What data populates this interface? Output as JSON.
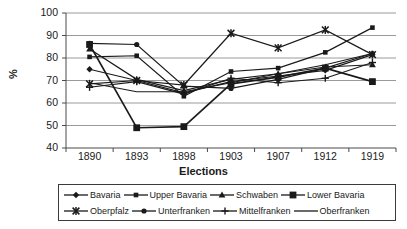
{
  "chart_data": {
    "type": "line",
    "title": "",
    "xlabel": "Elections",
    "ylabel": "%",
    "categories": [
      "1890",
      "1893",
      "1898",
      "1903",
      "1907",
      "1912",
      "1919"
    ],
    "x": [
      1890,
      1893,
      1898,
      1903,
      1907,
      1912,
      1919
    ],
    "ylim": [
      40,
      100
    ],
    "yticks": [
      40,
      50,
      60,
      70,
      80,
      90,
      100
    ],
    "grid": "horizontal",
    "legend_position": "bottom",
    "series": [
      {
        "name": "Bavaria",
        "marker": "diamond",
        "values": [
          75.0,
          70.0,
          64.5,
          69.5,
          72.0,
          74.5,
          81.5
        ]
      },
      {
        "name": "Upper Bavaria",
        "marker": "small-square",
        "values": [
          80.5,
          81.0,
          63.0,
          74.0,
          75.5,
          82.5,
          93.5
        ]
      },
      {
        "name": "Schwaben",
        "marker": "triangle",
        "values": [
          84.0,
          70.5,
          65.5,
          70.5,
          73.0,
          76.0,
          77.0
        ]
      },
      {
        "name": "Lower Bavaria",
        "marker": "large-square",
        "values": [
          86.0,
          49.0,
          49.5,
          68.5,
          71.5,
          75.5,
          69.5
        ]
      },
      {
        "name": "Oberpfalz",
        "marker": "star",
        "values": [
          68.5,
          70.0,
          68.0,
          91.0,
          84.5,
          92.5,
          81.5
        ]
      },
      {
        "name": "Unterfranken",
        "marker": "circle",
        "values": [
          86.5,
          86.0,
          67.5,
          66.5,
          70.5,
          75.5,
          82.0
        ]
      },
      {
        "name": "Mittelfranken",
        "marker": "plus",
        "values": [
          67.0,
          69.5,
          64.0,
          71.0,
          69.0,
          71.0,
          78.0
        ]
      },
      {
        "name": "Oberfranken",
        "marker": "none",
        "values": [
          69.0,
          65.0,
          65.0,
          69.0,
          73.0,
          77.0,
          82.0
        ]
      }
    ]
  },
  "axes": {
    "y_label": "%",
    "x_label": "Elections",
    "y_ticks": [
      "100",
      "90",
      "80",
      "70",
      "60",
      "50",
      "40"
    ],
    "x_ticks": [
      "1890",
      "1893",
      "1898",
      "1903",
      "1907",
      "1912",
      "1919"
    ]
  },
  "legend": {
    "rows": [
      [
        {
          "label": "Bavaria",
          "marker": "diamond"
        },
        {
          "label": "Upper Bavaria",
          "marker": "small-square"
        },
        {
          "label": "Schwaben",
          "marker": "triangle"
        },
        {
          "label": "Lower Bavaria",
          "marker": "large-square"
        }
      ],
      [
        {
          "label": "Oberpfalz",
          "marker": "star"
        },
        {
          "label": "Unterfranken",
          "marker": "circle"
        },
        {
          "label": "Mittelfranken",
          "marker": "plus"
        },
        {
          "label": "Oberfranken",
          "marker": "none"
        }
      ]
    ]
  },
  "colors": {
    "series": "#1a1a1a",
    "grid": "#9a9a9a",
    "axis": "#4a4a4a",
    "text": "#1a1a1a",
    "background": "#ffffff"
  }
}
